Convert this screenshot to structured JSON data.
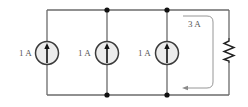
{
  "diagram": {
    "type": "circuit",
    "sources": [
      {
        "label": "1 A",
        "kind": "current-source",
        "direction": "up"
      },
      {
        "label": "1 A",
        "kind": "current-source",
        "direction": "up"
      },
      {
        "label": "1 A",
        "kind": "current-source",
        "direction": "up"
      }
    ],
    "loop_current": {
      "label": "3 A",
      "direction": "down-then-left"
    },
    "resistor": {
      "label": ""
    },
    "colors": {
      "wire": "#6b6b6b",
      "node": "#111111",
      "source_fill": "#ececec"
    }
  }
}
